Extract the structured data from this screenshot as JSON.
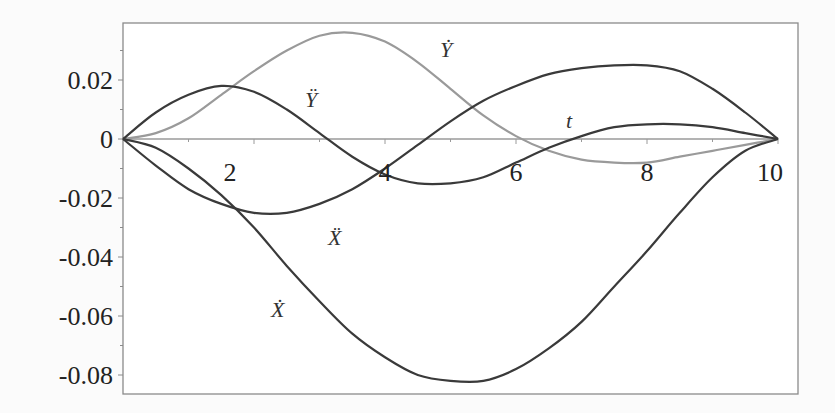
{
  "chart_data": {
    "type": "line",
    "title": "",
    "xlabel": "t",
    "ylabel": "",
    "xlim": [
      0,
      10
    ],
    "ylim": [
      -0.086,
      0.039
    ],
    "grid": false,
    "legend": "none (inline curve labels)",
    "x_ticks": [
      2,
      4,
      6,
      8,
      10
    ],
    "x_tick_labels": [
      "2",
      "4",
      "6",
      "8",
      "10"
    ],
    "y_ticks": [
      0.02,
      0,
      -0.02,
      -0.04,
      -0.06,
      -0.08
    ],
    "y_tick_labels": [
      "0.02",
      "0",
      "-0.02",
      "-0.04",
      "-0.06",
      "-0.08"
    ],
    "x": [
      0,
      0.5,
      1,
      1.5,
      2,
      2.5,
      3,
      3.5,
      4,
      4.5,
      5,
      5.5,
      6,
      6.5,
      7,
      7.5,
      8,
      8.5,
      9,
      9.5,
      10
    ],
    "series": [
      {
        "name": "Ẏ",
        "label": "Y-dot",
        "color": "#9a9a9a",
        "values": [
          0,
          0.002,
          0.007,
          0.015,
          0.023,
          0.03,
          0.035,
          0.036,
          0.033,
          0.026,
          0.017,
          0.008,
          0.001,
          -0.004,
          -0.007,
          -0.008,
          -0.008,
          -0.006,
          -0.004,
          -0.002,
          0
        ]
      },
      {
        "name": "Ÿ",
        "label": "Y-double-dot",
        "color": "#3a3a3a",
        "values": [
          0,
          0.009,
          0.015,
          0.018,
          0.016,
          0.01,
          0.002,
          -0.006,
          -0.012,
          -0.015,
          -0.015,
          -0.013,
          -0.008,
          -0.003,
          0.001,
          0.004,
          0.005,
          0.005,
          0.004,
          0.002,
          0
        ]
      },
      {
        "name": "Ẍ",
        "label": "X-double-dot",
        "color": "#3a3a3a",
        "values": [
          0,
          -0.009,
          -0.017,
          -0.022,
          -0.025,
          -0.025,
          -0.022,
          -0.017,
          -0.01,
          -0.002,
          0.006,
          0.013,
          0.018,
          0.022,
          0.024,
          0.025,
          0.025,
          0.023,
          0.017,
          0.009,
          0
        ]
      },
      {
        "name": "Ẋ",
        "label": "X-dot",
        "color": "#3a3a3a",
        "values": [
          0,
          -0.003,
          -0.01,
          -0.019,
          -0.03,
          -0.043,
          -0.055,
          -0.066,
          -0.074,
          -0.08,
          -0.082,
          -0.082,
          -0.078,
          -0.071,
          -0.062,
          -0.05,
          -0.038,
          -0.025,
          -0.013,
          -0.004,
          0
        ]
      }
    ],
    "annotations": [
      {
        "text": "Ẏ",
        "t": 6.1,
        "y": 0.033
      },
      {
        "text": "Ÿ",
        "t": 2.9,
        "y": 0.013
      },
      {
        "text": "Ẍ",
        "t": 3.2,
        "y": -0.034
      },
      {
        "text": "Ẋ",
        "t": 2.3,
        "y": -0.061
      },
      {
        "text": "t",
        "t": 6.8,
        "y": 0.007
      }
    ]
  },
  "labels": {
    "ydot": "Ẏ",
    "yddot": "Ÿ",
    "xddot": "Ẍ",
    "xdot": "Ẋ",
    "t": "t",
    "x_ticks": [
      "2",
      "4",
      "6",
      "8",
      "10"
    ],
    "y_ticks": [
      "0.02",
      "0",
      "-0.02",
      "-0.04",
      "-0.06",
      "-0.08"
    ]
  }
}
